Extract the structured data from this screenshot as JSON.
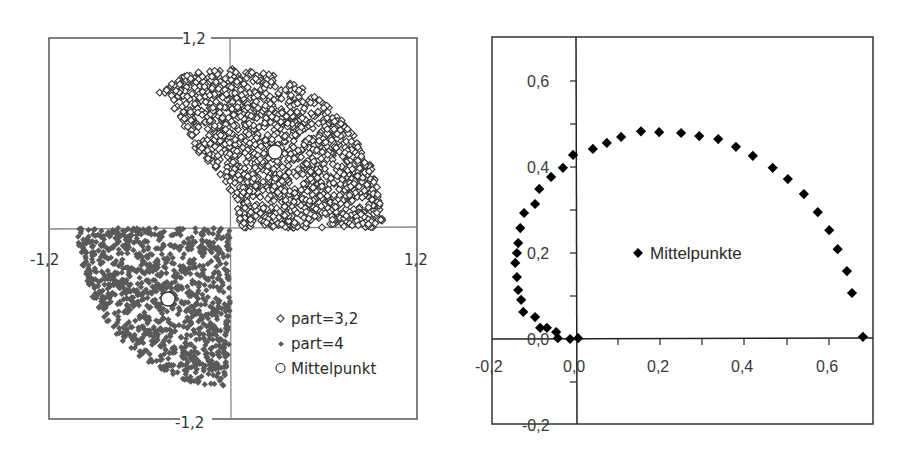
{
  "chart_data": [
    {
      "type": "scatter",
      "title": "",
      "xlabel": "",
      "ylabel": "",
      "xlim": [
        -1.2,
        1.2
      ],
      "ylim": [
        -1.2,
        1.2
      ],
      "grid": false,
      "legend_position": "lower right (inside)",
      "tick_labels": {
        "x_left": "-1,2",
        "x_right": "1,2",
        "y_top": "1,2",
        "y_bottom": "-1,2"
      },
      "series": [
        {
          "name": "part=3,2",
          "marker": "open-diamond",
          "color": "#3a3a3a",
          "description": "Approx. 1000+ random points filling a wedge/lens region in quadrant I (x from ~-0.5 to ~1.0, y from 0 to ~1.0), bounded by arcs",
          "region": {
            "x_range": [
              -0.5,
              1.0
            ],
            "y_range": [
              0.0,
              1.0
            ]
          }
        },
        {
          "name": "part=4",
          "marker": "filled-diamond",
          "color": "#555555",
          "description": "Approx. 1000+ random points filling a quarter disk in quadrant III (radius ~1.0, centered at origin)",
          "region": {
            "x_range": [
              -1.0,
              0.0
            ],
            "y_range": [
              -1.0,
              0.0
            ]
          }
        },
        {
          "name": "Mittelpunkt",
          "marker": "open-circle",
          "color": "#000000",
          "points": [
            {
              "x": 0.38,
              "y": 0.52
            },
            {
              "x": -0.53,
              "y": -0.58
            }
          ]
        }
      ],
      "legend": [
        "part=3,2",
        "part=4",
        "Mittelpunkt"
      ]
    },
    {
      "type": "scatter",
      "title": "",
      "xlabel": "",
      "ylabel": "",
      "xlim": [
        -0.2,
        0.7
      ],
      "ylim": [
        -0.2,
        0.7
      ],
      "grid": false,
      "legend_position": "center (inside)",
      "x_tick_labels": [
        "-0,2",
        "0,0",
        "0,2",
        "0,4",
        "0,6"
      ],
      "y_tick_labels": [
        "0,6",
        "0,4",
        "0,2",
        "0,0",
        "-0,2"
      ],
      "series": [
        {
          "name": "Mittelpunkte",
          "marker": "filled-diamond",
          "color": "#000000",
          "x": [
            0.68,
            0.654,
            0.642,
            0.62,
            0.6,
            0.573,
            0.54,
            0.502,
            0.466,
            0.419,
            0.379,
            0.337,
            0.292,
            0.249,
            0.197,
            0.154,
            0.107,
            0.073,
            0.04,
            -0.007,
            -0.031,
            -0.059,
            -0.087,
            -0.097,
            -0.123,
            -0.132,
            -0.137,
            -0.14,
            -0.144,
            -0.14,
            -0.137,
            -0.13,
            -0.125,
            -0.097,
            -0.085,
            -0.069,
            -0.047,
            -0.043,
            -0.014,
            0.005
          ],
          "y": [
            0.005,
            0.107,
            0.158,
            0.209,
            0.253,
            0.295,
            0.337,
            0.372,
            0.398,
            0.426,
            0.447,
            0.465,
            0.472,
            0.479,
            0.481,
            0.483,
            0.47,
            0.456,
            0.442,
            0.428,
            0.398,
            0.377,
            0.349,
            0.314,
            0.293,
            0.258,
            0.223,
            0.2,
            0.177,
            0.144,
            0.114,
            0.091,
            0.063,
            0.051,
            0.026,
            0.026,
            0.016,
            0.002,
            0.0,
            0.002
          ]
        }
      ],
      "legend": [
        "Mittelpunkte"
      ]
    }
  ],
  "left_chart": {
    "labels": {
      "y_top": "1,2",
      "y_bottom": "-1,2",
      "x_left": "-1,2",
      "x_right": "1,2"
    },
    "legend": [
      {
        "label": "part=3,2"
      },
      {
        "label": "part=4"
      },
      {
        "label": "Mittelpunkt"
      }
    ]
  },
  "right_chart": {
    "x_ticks": [
      "-0,2",
      "0,0",
      "0,2",
      "0,4",
      "0,6"
    ],
    "y_ticks": [
      "0,6",
      "0,4",
      "0,2",
      "0,0",
      "-0,2"
    ],
    "legend": [
      {
        "label": "Mittelpunkte"
      }
    ]
  }
}
